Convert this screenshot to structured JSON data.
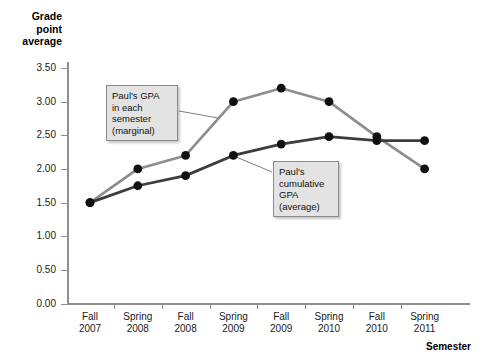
{
  "chart_data": {
    "type": "line",
    "title": "",
    "xlabel": "Semester",
    "ylabel": "Grade point average",
    "categories": [
      "Fall\n2007",
      "Spring\n2008",
      "Fall\n2008",
      "Spring\n2009",
      "Fall\n2009",
      "Spring\n2010",
      "Fall\n2010",
      "Spring\n2011"
    ],
    "ylim": [
      0.0,
      3.5
    ],
    "yticks": [
      "0.00",
      "0.50",
      "1.00",
      "1.50",
      "2.00",
      "2.50",
      "3.00",
      "3.50"
    ],
    "ytick_values": [
      0.0,
      0.5,
      1.0,
      1.5,
      2.0,
      2.5,
      3.0,
      3.5
    ],
    "grid": false,
    "legend": "none",
    "series": [
      {
        "name": "Paul's GPA in each semester (marginal)",
        "color": "#8d8d8d",
        "marker_color": "#111111",
        "values": [
          1.5,
          2.0,
          2.2,
          3.0,
          3.2,
          3.0,
          2.48,
          2.0
        ]
      },
      {
        "name": "Paul's cumulative GPA (average)",
        "color": "#3c3c3c",
        "marker_color": "#111111",
        "values": [
          1.5,
          1.75,
          1.9,
          2.2,
          2.37,
          2.48,
          2.42,
          2.42
        ]
      }
    ],
    "annotations": [
      {
        "id": "marginal",
        "text": "Paul's GPA\nin each\nsemester\n(marginal)",
        "target_series": 0,
        "target_index": 3
      },
      {
        "id": "cumulative",
        "text": "Paul's\ncumulative\nGPA\n(average)",
        "target_series": 1,
        "target_index": 3
      }
    ]
  },
  "axes": {
    "y_title": "Grade\npoint\naverage",
    "x_title": "Semester"
  },
  "colors": {
    "background": "#ffffff",
    "axis": "#8e8e8e",
    "marginal_line": "#8d8d8d",
    "cumulative_line": "#3c3c3c",
    "marker": "#111111",
    "callout_fill": "#e3e3e3",
    "callout_border": "#8a8a8a",
    "leader_line": "#6f6f6f"
  }
}
